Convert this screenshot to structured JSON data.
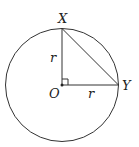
{
  "diagram": {
    "points": {
      "X": {
        "label": "X"
      },
      "Y": {
        "label": "Y"
      },
      "O": {
        "label": "O"
      }
    },
    "radius_labels": {
      "vertical": "r",
      "horizontal": "r"
    },
    "right_angle_at": "O",
    "stroke_color": "#333333"
  }
}
